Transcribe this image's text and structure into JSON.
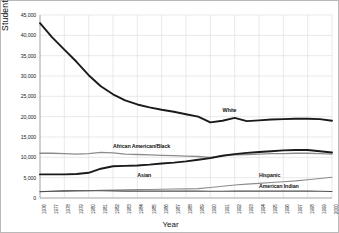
{
  "chart_data": {
    "type": "line",
    "title": "",
    "xlabel": "Year",
    "ylabel": "Student Enrollment",
    "grid": true,
    "legend_position": "inline-direct-labels",
    "xlim": [
      1976,
      2000
    ],
    "ylim": [
      0,
      45000
    ],
    "yticks": [
      0,
      5000,
      10000,
      15000,
      20000,
      25000,
      30000,
      35000,
      40000,
      45000
    ],
    "ytick_labels": [
      "0",
      "5,000",
      "10,000",
      "15,000",
      "20,000",
      "25,000",
      "30,000",
      "35,000",
      "40,000",
      "45,000"
    ],
    "x": [
      1976,
      1977,
      1978,
      1979,
      1980,
      1981,
      1982,
      1983,
      1984,
      1985,
      1986,
      1987,
      1988,
      1989,
      1990,
      1991,
      1992,
      1993,
      1994,
      1995,
      1996,
      1997,
      1998,
      1999,
      2000
    ],
    "xtick_labels": [
      "1976",
      "1977",
      "1978",
      "1979",
      "1980",
      "1981",
      "1982",
      "1983",
      "1984",
      "1985",
      "1986",
      "1987",
      "1988",
      "1989",
      "1990",
      "1991",
      "1992",
      "1993",
      "1994",
      "1995",
      "1996",
      "1997",
      "1998",
      "1999",
      "2000"
    ],
    "series": [
      {
        "name": "White",
        "color": "#1a1a1a",
        "width": 1.9,
        "label_x": 1991,
        "label_y": 21500,
        "values": [
          43000,
          39500,
          36500,
          33500,
          30200,
          27500,
          25500,
          24000,
          23000,
          22300,
          21700,
          21200,
          20600,
          20000,
          18600,
          19000,
          19700,
          18900,
          19100,
          19300,
          19400,
          19500,
          19500,
          19400,
          19000
        ]
      },
      {
        "name": "African American/Black",
        "color": "#8c8c8c",
        "width": 1.3,
        "label_x": 1982,
        "label_y": 12600,
        "values": [
          11000,
          11000,
          10900,
          10800,
          10900,
          11200,
          11100,
          10800,
          10700,
          10600,
          10500,
          10400,
          10300,
          10200,
          10000,
          10400,
          10600,
          10700,
          10800,
          10900,
          10900,
          11000,
          11000,
          10900,
          10800
        ]
      },
      {
        "name": "Asian",
        "color": "#1a1a1a",
        "width": 1.9,
        "label_x": 1984,
        "label_y": 5500,
        "values": [
          5800,
          5800,
          5800,
          5900,
          6200,
          7200,
          7800,
          7900,
          8000,
          8200,
          8500,
          8700,
          9000,
          9400,
          9800,
          10400,
          10800,
          11100,
          11300,
          11500,
          11700,
          11800,
          11800,
          11500,
          11200
        ]
      },
      {
        "name": "Hispanic",
        "color": "#8c8c8c",
        "width": 1.1,
        "label_x": 1994,
        "label_y": 5500,
        "values": [
          1600,
          1650,
          1700,
          1750,
          1800,
          1900,
          1950,
          2000,
          2050,
          2100,
          2150,
          2200,
          2250,
          2300,
          2600,
          2900,
          3200,
          3400,
          3600,
          3800,
          4000,
          4200,
          4500,
          4800,
          5100
        ]
      },
      {
        "name": "American Indian",
        "color": "#4d4d4d",
        "width": 1.1,
        "label_x": 1994,
        "label_y": 2700,
        "values": [
          1550,
          1650,
          1750,
          1800,
          1800,
          1800,
          1750,
          1700,
          1700,
          1700,
          1700,
          1700,
          1700,
          1700,
          1650,
          1650,
          1700,
          1700,
          1700,
          1700,
          1700,
          1700,
          1700,
          1650,
          1600
        ]
      }
    ]
  }
}
